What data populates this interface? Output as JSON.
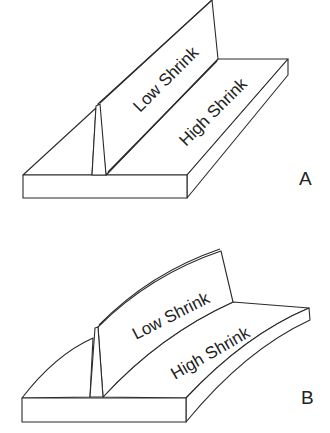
{
  "figures": [
    {
      "id": "A",
      "label": "A",
      "web_text": "Low Shrink",
      "flange_text": "High Shrink",
      "state": "straight"
    },
    {
      "id": "B",
      "label": "B",
      "web_text": "Low Shrink",
      "flange_text": "High Shrink",
      "state": "bowed"
    }
  ],
  "colors": {
    "line": "#2a2a2a",
    "background": "#ffffff"
  }
}
